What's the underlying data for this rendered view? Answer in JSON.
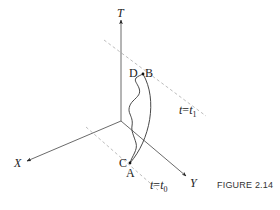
{
  "figure": {
    "caption": "FIGURE 2.14",
    "axes": {
      "t": "T",
      "x": "X",
      "y": "Y"
    },
    "points": {
      "a": "A",
      "b": "B",
      "c": "C",
      "d": "D"
    },
    "time_slices": {
      "upper": {
        "lhs": "t",
        "eq": "=",
        "rhs": "t",
        "sub": "1"
      },
      "lower": {
        "lhs": "t",
        "eq": "=",
        "rhs": "t",
        "sub": "0"
      }
    },
    "colors": {
      "line": "#333333",
      "dashed": "#b0b0b0",
      "background": "#ffffff"
    }
  }
}
